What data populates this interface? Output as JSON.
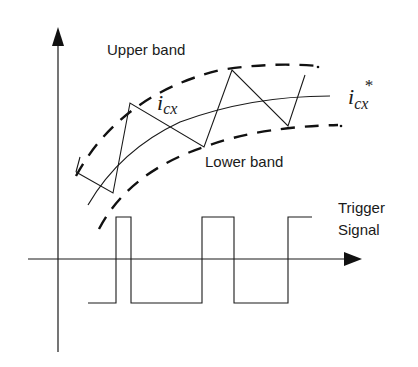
{
  "diagram": {
    "labels": {
      "upper_band": "Upper band",
      "lower_band": "Lower band",
      "actual_current": {
        "base": "i",
        "sub": "cx"
      },
      "reference_current": {
        "base": "i",
        "sub": "cx",
        "sup": "*"
      },
      "trigger_line1": "Trigger",
      "trigger_line2": "Signal"
    },
    "colors": {
      "stroke": "#1a1a1a",
      "background": "#ffffff"
    }
  }
}
